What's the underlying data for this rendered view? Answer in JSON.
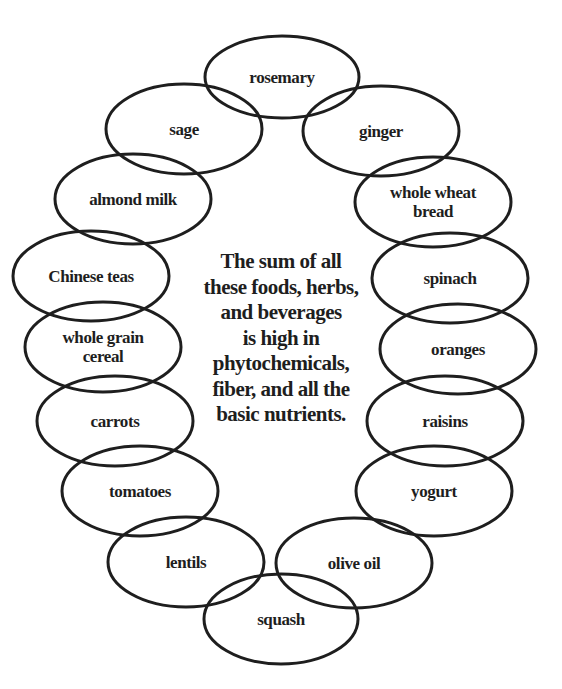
{
  "diagram": {
    "center_text": "The sum of all\nthese foods, herbs,\nand beverages\nis high in\nphytochemicals,\nfiber, and all the\nbasic nutrients.",
    "stroke_color": "#1e1e1e",
    "items": [
      {
        "label": "rosemary",
        "cx": 282,
        "cy": 77,
        "rx": 77,
        "ry": 41
      },
      {
        "label": "sage",
        "cx": 184,
        "cy": 129,
        "rx": 78,
        "ry": 45
      },
      {
        "label": "ginger",
        "cx": 381,
        "cy": 131,
        "rx": 78,
        "ry": 45
      },
      {
        "label": "almond milk",
        "cx": 133,
        "cy": 199,
        "rx": 78,
        "ry": 45
      },
      {
        "label": "whole wheat\nbread",
        "cx": 433,
        "cy": 202,
        "rx": 78,
        "ry": 45
      },
      {
        "label": "Chinese teas",
        "cx": 91,
        "cy": 276,
        "rx": 78,
        "ry": 45
      },
      {
        "label": "spinach",
        "cx": 450,
        "cy": 278,
        "rx": 78,
        "ry": 45
      },
      {
        "label": "whole grain\ncereal",
        "cx": 103,
        "cy": 347,
        "rx": 78,
        "ry": 45
      },
      {
        "label": "oranges",
        "cx": 458,
        "cy": 349,
        "rx": 78,
        "ry": 45
      },
      {
        "label": "carrots",
        "cx": 115,
        "cy": 421,
        "rx": 78,
        "ry": 45
      },
      {
        "label": "raisins",
        "cx": 445,
        "cy": 421,
        "rx": 78,
        "ry": 45
      },
      {
        "label": "tomatoes",
        "cx": 140,
        "cy": 491,
        "rx": 78,
        "ry": 45
      },
      {
        "label": "yogurt",
        "cx": 434,
        "cy": 491,
        "rx": 78,
        "ry": 45
      },
      {
        "label": "lentils",
        "cx": 186,
        "cy": 562,
        "rx": 78,
        "ry": 45
      },
      {
        "label": "olive oil",
        "cx": 354,
        "cy": 563,
        "rx": 78,
        "ry": 45
      },
      {
        "label": "squash",
        "cx": 281,
        "cy": 619,
        "rx": 77,
        "ry": 45
      }
    ]
  }
}
